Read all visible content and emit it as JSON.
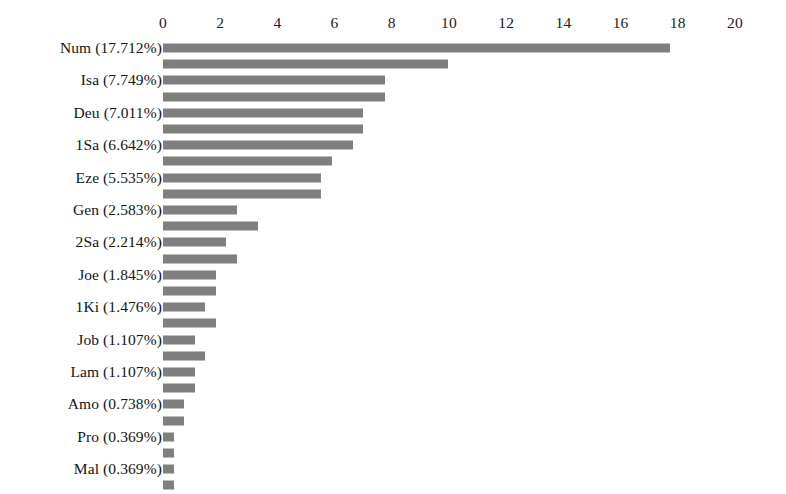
{
  "chart_data": {
    "type": "bar",
    "orientation": "horizontal",
    "title": "",
    "subtitle": "",
    "xlabel": "",
    "ylabel": "",
    "xlim": [
      0,
      20
    ],
    "grid": false,
    "legend": null,
    "bar_color": "#7f7f7f",
    "background_color": "#ffffff",
    "x_ticks": [
      0,
      2,
      4,
      6,
      8,
      10,
      12,
      14,
      16,
      18,
      20
    ],
    "x_tick_labels": [
      "0",
      "2",
      "4",
      "6",
      "8",
      "10",
      "12",
      "14",
      "16",
      "18",
      "20"
    ],
    "categories": [
      "Num (17.712%)",
      "",
      "Isa (7.749%)",
      "",
      "Deu (7.011%)",
      "",
      "1Sa (6.642%)",
      "",
      "Eze (5.535%)",
      "",
      "Gen (2.583%)",
      "",
      "2Sa (2.214%)",
      "",
      "Joe (1.845%)",
      "",
      "1Ki (1.476%)",
      "",
      "Job (1.107%)",
      "",
      "Lam (1.107%)",
      "",
      "Amo (0.738%)",
      "",
      "Pro (0.369%)",
      "",
      "Mal (0.369%)",
      ""
    ],
    "values": [
      17.71,
      9.96,
      7.75,
      7.75,
      7.01,
      7.01,
      6.64,
      5.9,
      5.54,
      5.54,
      2.58,
      3.32,
      2.21,
      2.58,
      1.85,
      1.85,
      1.48,
      1.85,
      1.11,
      1.48,
      1.11,
      1.11,
      0.74,
      0.74,
      0.37,
      0.37,
      0.37,
      0.37
    ],
    "labeled_series": {
      "categories": [
        "Num",
        "Isa",
        "Deu",
        "1Sa",
        "Eze",
        "Gen",
        "2Sa",
        "Joe",
        "1Ki",
        "Job",
        "Lam",
        "Amo",
        "Pro",
        "Mal"
      ],
      "percent_values": [
        17.712,
        7.749,
        7.011,
        6.642,
        5.535,
        2.583,
        2.214,
        1.845,
        1.476,
        1.107,
        1.107,
        0.738,
        0.369,
        0.369
      ],
      "labels": [
        "Num (17.712%)",
        "Isa (7.749%)",
        "Deu (7.011%)",
        "1Sa (6.642%)",
        "Eze (5.535%)",
        "Gen (2.583%)",
        "2Sa (2.214%)",
        "Joe (1.845%)",
        "1Ki (1.476%)",
        "Job (1.107%)",
        "Lam (1.107%)",
        "Amo (0.738%)",
        "Pro (0.369%)",
        "Mal (0.369%)"
      ]
    }
  },
  "axis_geometry": {
    "origin_x_px": 163,
    "px_per_unit": 28.6,
    "plot_top_px": 40,
    "row_pitch_px": 16.2,
    "bar_height_px": 9
  }
}
